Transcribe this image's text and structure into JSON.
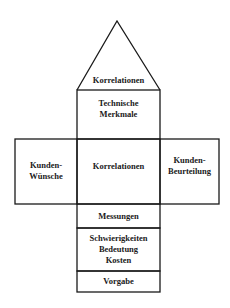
{
  "diagram": {
    "type": "house-of-quality",
    "stroke_color": "#1a1a1a",
    "background": "#ffffff",
    "roof": {
      "label": "Korrelationen"
    },
    "technical": {
      "label": "Technische\nMerkmale"
    },
    "customer_wishes": {
      "label": "Kunden-\nWünsche"
    },
    "center": {
      "label": "Korrelationen"
    },
    "customer_rating": {
      "label": "Kunden-\nBeurteilung"
    },
    "measurements": {
      "label": "Messungen"
    },
    "difficulty": {
      "label": "Schwierigkeiten\nBedeutung\nKosten"
    },
    "target": {
      "label": "Vorgabe"
    }
  }
}
